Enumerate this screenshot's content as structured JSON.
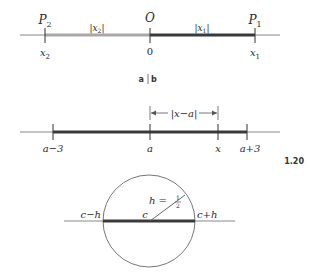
{
  "figure_number": "1.20",
  "panel_caption": {
    "a": "a",
    "sep": "|",
    "b": "b"
  },
  "panel_a": {
    "points": [
      {
        "label": "P",
        "sub": "2",
        "below": "x",
        "below_sub": "2"
      },
      {
        "label": "O",
        "below": "0"
      },
      {
        "label": "P",
        "sub": "1",
        "below": "x",
        "below_sub": "1"
      }
    ],
    "segments": [
      {
        "label": "|x",
        "sub": "2",
        "close": "|",
        "color": "#9a9a9a"
      },
      {
        "label": "|x",
        "sub": "1",
        "close": "|",
        "color": "#3a3a3a"
      }
    ]
  },
  "panel_b": {
    "ticks": [
      "a−3",
      "a",
      "x",
      "a+3"
    ],
    "distance_label": "|x−a|",
    "segment_color": "#3a3a3a"
  },
  "panel_c": {
    "center_label": "c",
    "left_label": "c−h",
    "right_label": "c+h",
    "radius_label": "h =",
    "radius_num": "1",
    "radius_den": "2",
    "segment_color": "#3a3a3a"
  }
}
